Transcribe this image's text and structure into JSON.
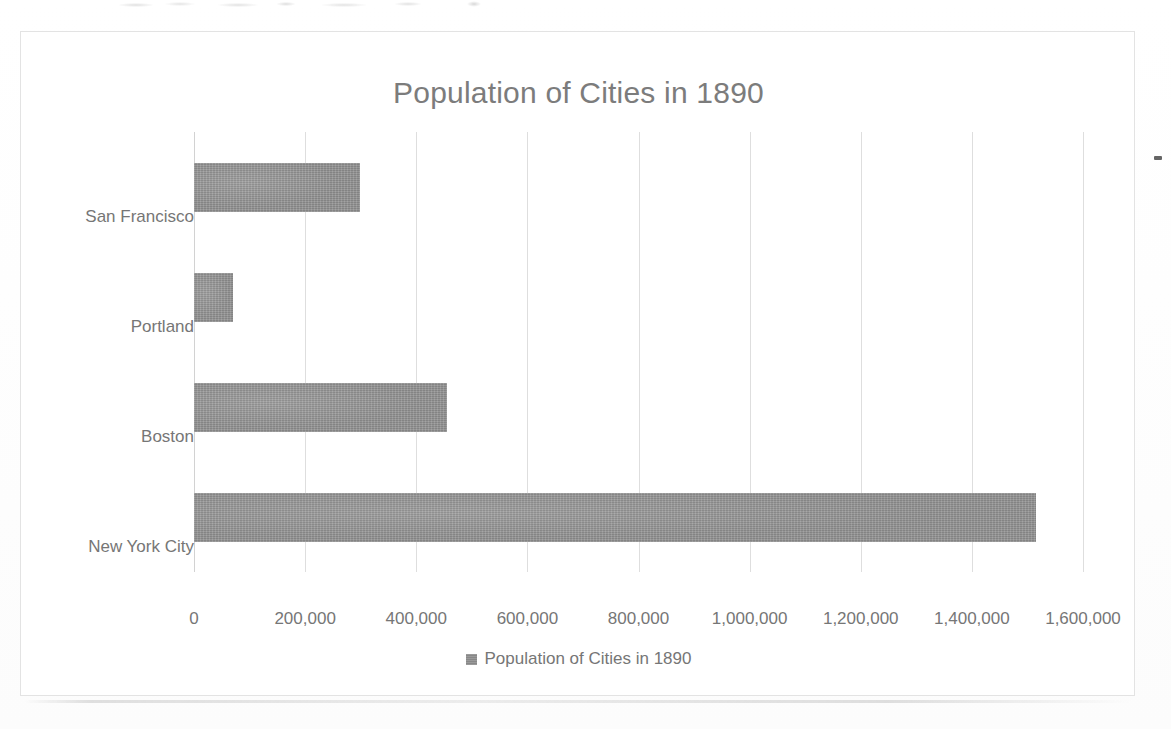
{
  "scan": {
    "top_smudge_note": "illegible cut-off text fragment at top edge of scan",
    "edge_mark_note": "small ink mark on right frame border"
  },
  "chart_data": {
    "type": "bar",
    "orientation": "horizontal",
    "title": "Population of Cities in 1890",
    "xlabel": "",
    "ylabel": "",
    "categories": [
      "New York City",
      "Boston",
      "Portland",
      "San Francisco"
    ],
    "values": [
      1515000,
      455000,
      70000,
      299000
    ],
    "series": [
      {
        "name": "Population of Cities in 1890",
        "color": "#8f8f8f",
        "values": [
          1515000,
          455000,
          70000,
          299000
        ]
      }
    ],
    "xlim": [
      0,
      1600000
    ],
    "xticks": [
      0,
      200000,
      400000,
      600000,
      800000,
      1000000,
      1200000,
      1400000,
      1600000
    ],
    "xtick_labels": [
      "0",
      "200,000",
      "400,000",
      "600,000",
      "800,000",
      "1,000,000",
      "1,200,000",
      "1,400,000",
      "1,600,000"
    ],
    "grid": "vertical",
    "legend": {
      "position": "bottom",
      "entries": [
        {
          "label": "Population of Cities in 1890",
          "color": "#8f8f8f"
        }
      ]
    },
    "colors": {
      "bar": "#8f8f8f",
      "text": "#767676",
      "title_text": "#7c7c7c",
      "gridline": "#dedede",
      "frame": "#e3e3e3",
      "background": "#ffffff"
    }
  }
}
